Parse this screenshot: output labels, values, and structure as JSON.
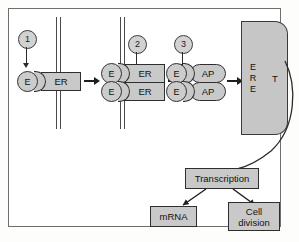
{
  "figure": {
    "colors": {
      "fill_gray": "#c9c9c9",
      "dna_gray": "#c6c6c6",
      "outline": "#2e2e2e",
      "arrow": "#1f1f1f",
      "frame_border": "#6e6e6e",
      "background": "#ffffff"
    }
  },
  "steps": [
    {
      "number": "1",
      "name": "ligand-binding"
    },
    {
      "number": "2",
      "name": "dimerization"
    },
    {
      "number": "3",
      "name": "coactivator-binding"
    }
  ],
  "stage1": {
    "ligand_label": "E",
    "receptor_label": "ER"
  },
  "stage2": {
    "ligand_label": "E",
    "receptor_label": "ER",
    "top_receptor_label": "ER",
    "bottom_receptor_label": "ER"
  },
  "stage3": {
    "ligand_label": "E",
    "cofactor_label": "AP",
    "top_cofactor_label": "AP",
    "bottom_cofactor_label": "AP"
  },
  "dna": {
    "ere_letters": [
      "E",
      "R",
      "E"
    ],
    "ere_label": "ERE",
    "target_gene_label": "T"
  },
  "outcomes": {
    "transcription_label": "Transcription",
    "mrna_label": "mRNA",
    "cell_division_label": "Cell division",
    "cell_division_line1": "Cell",
    "cell_division_line2": "division"
  }
}
